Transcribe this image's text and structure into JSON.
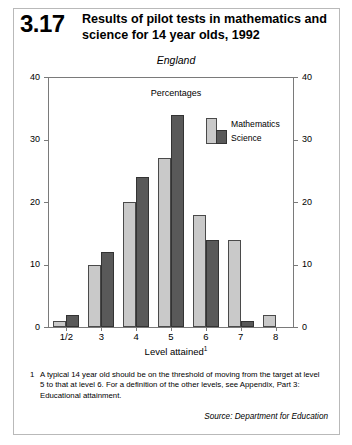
{
  "figure": {
    "number": "3.17",
    "title": "Results of pilot tests in mathematics and science for 14 year olds, 1992",
    "subtitle": "England",
    "unit_label": "Percentages",
    "footnote_marker": "1",
    "footnote": "A typical 14 year old should be on the threshold of moving from the target at level 5 to that at level 6. For a definition of the other levels, see Appendix, Part 3: Educational attainment.",
    "source": "Source: Department for Education"
  },
  "chart_data": {
    "type": "bar",
    "title": "Results of pilot tests in mathematics and science for 14 year olds, 1992",
    "subtitle": "England",
    "xlabel": "Level attained",
    "ylabel": "Percentages",
    "categories": [
      "1/2",
      "3",
      "4",
      "5",
      "6",
      "7",
      "8"
    ],
    "series": [
      {
        "name": "Mathematics",
        "color": "#c9c9c9",
        "values": [
          1,
          10,
          20,
          27,
          18,
          14,
          2
        ]
      },
      {
        "name": "Science",
        "color": "#595959",
        "values": [
          2,
          12,
          24,
          34,
          14,
          1,
          0
        ]
      }
    ],
    "ylim": [
      0,
      40
    ],
    "yticks": [
      0,
      10,
      20,
      30,
      40
    ],
    "ytick_labels_left": [
      "0",
      "10",
      "20",
      "30",
      "40"
    ],
    "ytick_labels_right": [
      "0",
      "10",
      "20",
      "30",
      "40"
    ],
    "grid": false,
    "legend_position": "inside top-right",
    "axis_note": "dual y-axes, identical scales on left and right"
  }
}
